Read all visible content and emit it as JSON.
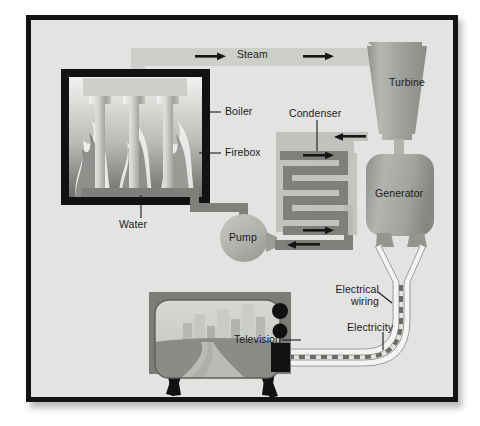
{
  "diagram": {
    "type": "process-flow-illustration",
    "background_color": "#e3e3e1",
    "frame_color": "#141414",
    "page_color": "#ffffff"
  },
  "labels": {
    "steam": "Steam",
    "turbine": "Turbine",
    "boiler": "Boiler",
    "firebox": "Firebox",
    "water": "Water",
    "pump": "Pump",
    "condenser": "Condenser",
    "generator": "Generator",
    "electrical_wiring_line1": "Electrical",
    "electrical_wiring_line2": "wiring",
    "electricity": "Electricity",
    "television": "Television"
  },
  "components": [
    {
      "name": "boiler",
      "label": "Boiler",
      "shape": "thick-black-rectangle",
      "leader": "right"
    },
    {
      "name": "firebox",
      "label": "Firebox",
      "shape": "flame-field",
      "leader": "right"
    },
    {
      "name": "water",
      "label": "Water",
      "shape": "dark-gray-pipe",
      "leader": "up"
    },
    {
      "name": "pump",
      "label": "Pump",
      "shape": "circle",
      "leader": "inside"
    },
    {
      "name": "condenser",
      "label": "Condenser",
      "shape": "serpentine-coil",
      "leader": "down"
    },
    {
      "name": "turbine",
      "label": "Turbine",
      "shape": "tapered-cone",
      "leader": "inside"
    },
    {
      "name": "generator",
      "label": "Generator",
      "shape": "rounded-rectangle",
      "leader": "inside"
    },
    {
      "name": "television",
      "label": "Television",
      "shape": "crt-tv",
      "leader": "right"
    },
    {
      "name": "electrical-wiring",
      "label": "Electrical wiring",
      "shape": "white-cable",
      "leader": "right"
    },
    {
      "name": "electricity",
      "label": "Electricity",
      "shape": "dashed-current",
      "leader": "down"
    },
    {
      "name": "steam",
      "label": "Steam",
      "shape": "light-gray-duct",
      "leader": "inside"
    }
  ],
  "flow_arrows": [
    {
      "name": "steam-arrow-left",
      "direction": "right",
      "on": "steam duct"
    },
    {
      "name": "steam-arrow-right",
      "direction": "right",
      "on": "steam duct"
    },
    {
      "name": "turbine-exhaust-arrow",
      "direction": "left",
      "on": "condenser inlet"
    },
    {
      "name": "condenser-arrow-upper",
      "direction": "right",
      "on": "condenser coil"
    },
    {
      "name": "condenser-arrow-lower",
      "direction": "right",
      "on": "condenser coil"
    },
    {
      "name": "condensate-return-arrow",
      "direction": "left",
      "on": "pump return line"
    }
  ],
  "colors": {
    "steam_duct": "#c9cbc6",
    "water_pipe": "#8b8d88",
    "condenser_body": "#b3b5b0",
    "turbine_body": "#9d9f9a",
    "generator_body": "#9d9f9a",
    "pump_body": "#b0b2ad",
    "tv_cabinet": "#7d7f7a",
    "tv_sky": "#c9cbc6",
    "tv_ground": "#8a8c87",
    "flame_light": "#ededea",
    "flame_dark": "#4a4c48",
    "wire_white": "#f4f4f2",
    "label_text": "#1b1b1b"
  },
  "tv_screen": {
    "scene": "city skyline with road",
    "buildings": 7,
    "controls": {
      "knobs": 2,
      "speaker_panel": 1
    }
  }
}
